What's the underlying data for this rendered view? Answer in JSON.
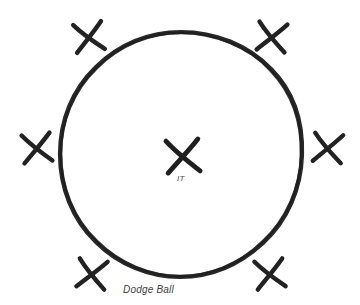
{
  "diagram": {
    "title": "Dodge Ball",
    "background_color": "#ffffff",
    "ink_color": "#262626",
    "center_label": "IT",
    "caption": "Dodge Ball",
    "circle": {
      "name": "dodge-ball-circle",
      "center_x": 181,
      "center_y": 154,
      "radius_x": 121,
      "radius_y": 122,
      "stroke_width": 4,
      "style": "hand-drawn"
    },
    "marks": [
      {
        "name": "player-x-top-left",
        "label": "X",
        "x": 89,
        "y": 37,
        "rotation": -8,
        "size": 30
      },
      {
        "name": "player-x-top-right",
        "label": "X",
        "x": 272,
        "y": 37,
        "rotation": 6,
        "size": 30
      },
      {
        "name": "player-x-left",
        "label": "X",
        "x": 37,
        "y": 148,
        "rotation": -6,
        "size": 30
      },
      {
        "name": "player-x-right",
        "label": "X",
        "x": 328,
        "y": 148,
        "rotation": 5,
        "size": 30
      },
      {
        "name": "player-x-bottom-left",
        "label": "X",
        "x": 92,
        "y": 274,
        "rotation": 7,
        "size": 30
      },
      {
        "name": "player-x-bottom-right",
        "label": "X",
        "x": 270,
        "y": 274,
        "rotation": -7,
        "size": 30
      },
      {
        "name": "it-player-x-center",
        "label": "X",
        "x": 183,
        "y": 156,
        "rotation": -4,
        "size": 34
      }
    ]
  }
}
